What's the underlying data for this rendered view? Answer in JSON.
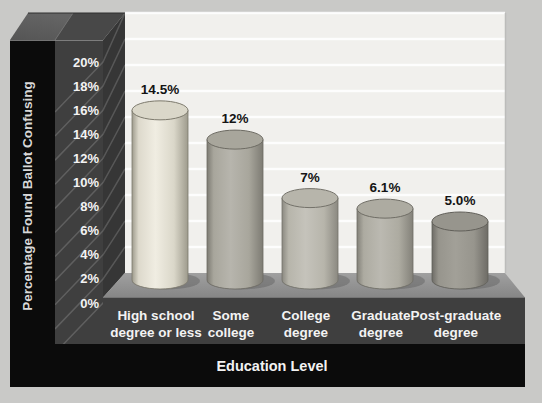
{
  "chart_data": {
    "type": "bar",
    "variant": "3d-cylinder",
    "title": "",
    "xlabel": "Education Level",
    "ylabel": "Percentage Found Ballot Confusing",
    "categories": [
      "High school degree or less",
      "Some college",
      "College degree",
      "Graduate degree",
      "Post-graduate degree"
    ],
    "category_lines": [
      [
        "High school",
        "degree or less"
      ],
      [
        "Some",
        "college"
      ],
      [
        "College",
        "degree"
      ],
      [
        "Graduate",
        "degree"
      ],
      [
        "Post-graduate",
        "degree"
      ]
    ],
    "values": [
      14.5,
      12,
      7,
      6.1,
      5.0
    ],
    "value_labels": [
      "14.5%",
      "12%",
      "7%",
      "6.1%",
      "5.0%"
    ],
    "y_ticks": [
      "0%",
      "2%",
      "4%",
      "6%",
      "8%",
      "10%",
      "12%",
      "14%",
      "16%",
      "18%",
      "20%"
    ],
    "ylim": [
      0,
      20
    ],
    "grid": true,
    "legend": false,
    "colors": {
      "page_background": "#c9c9c7",
      "wall": "#f1f0ed",
      "gridline": "#ffffff",
      "frame_black": "#0b0b0b",
      "frame_gray": "#3f3f3f",
      "side_face": "#363636",
      "hatch_line": "#ffffff",
      "bevel_left": "#646464",
      "bevel_right": "#484848",
      "floor_back": "#a0a0a0",
      "floor_front": "#868686",
      "floor_shadow": "#5f5f5f",
      "tick_text": "#f3f3f3",
      "category_text": "#f3f3f3",
      "value_text": "#141414",
      "axis_title_y_text": "#d8d8d8",
      "axis_title_x_text": "#f2f2f2",
      "cylinders": [
        {
          "edge": "#9e9b8d",
          "body": "#f0ede2",
          "top": "#dad7c9",
          "outline": "#7c796c"
        },
        {
          "edge": "#7d7b73",
          "body": "#b7b5ad",
          "top": "#a8a69c",
          "outline": "#6d6b63"
        },
        {
          "edge": "#8b8981",
          "body": "#c5c3bb",
          "top": "#b7b5ab",
          "outline": "#74726a"
        },
        {
          "edge": "#838179",
          "body": "#bbb9b1",
          "top": "#adaba1",
          "outline": "#6f6d65"
        },
        {
          "edge": "#6e6c66",
          "body": "#a2a098",
          "top": "#97958d",
          "outline": "#615f59"
        }
      ]
    }
  }
}
